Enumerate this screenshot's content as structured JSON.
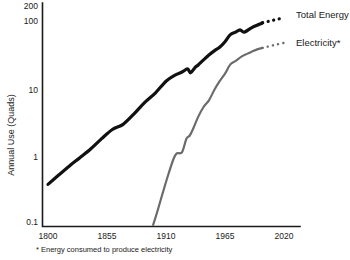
{
  "chart_data": {
    "type": "line",
    "title": "",
    "xlabel": "",
    "ylabel": "Annual Use (Quads)",
    "xlim": [
      1800,
      2020
    ],
    "ylim": [
      0.1,
      200
    ],
    "yscale": "log",
    "grid": false,
    "legend_position": "right-inline",
    "xticks": [
      "1800",
      "1855",
      "1910",
      "1965",
      "2020"
    ],
    "xtick_values": [
      1800,
      1855,
      1910,
      1965,
      2020
    ],
    "yticks": [
      "200",
      "100",
      "10",
      "1",
      "0.1"
    ],
    "ytick_values": [
      200,
      100,
      10,
      1,
      0.1
    ],
    "annotations": [
      "* Energy consumed to produce electricity"
    ],
    "series": [
      {
        "name": "Total Energy",
        "color": "#111111",
        "style": "solid-with-dotted-extension",
        "x": [
          1800,
          1810,
          1820,
          1830,
          1840,
          1850,
          1860,
          1870,
          1880,
          1890,
          1900,
          1910,
          1918,
          1925,
          1930,
          1933,
          1937,
          1940,
          1945,
          1950,
          1955,
          1960,
          1965,
          1970,
          1975,
          1979,
          1983,
          1990,
          1997,
          2000
        ],
        "y": [
          0.4,
          0.55,
          0.75,
          1.0,
          1.35,
          1.9,
          2.6,
          3.1,
          4.4,
          6.5,
          9.0,
          13.5,
          16.5,
          18.5,
          20.5,
          18.0,
          21.5,
          23.5,
          28.0,
          33.0,
          38.0,
          43.0,
          52.0,
          66.0,
          72.0,
          78.0,
          72.0,
          84.0,
          94.0,
          99.0
        ],
        "dotted_x": [
          2000,
          2010,
          2020
        ],
        "dotted_y": [
          99.0,
          108.0,
          118.0
        ]
      },
      {
        "name": "Electricity*",
        "color": "#6b6b6b",
        "style": "solid-with-dotted-extension",
        "x": [
          1898,
          1902,
          1907,
          1912,
          1917,
          1920,
          1925,
          1929,
          1932,
          1935,
          1940,
          1945,
          1950,
          1955,
          1960,
          1965,
          1970,
          1975,
          1980,
          1985,
          1990,
          1995,
          2000
        ],
        "y": [
          0.1,
          0.16,
          0.3,
          0.55,
          0.95,
          1.15,
          1.2,
          1.9,
          2.1,
          2.6,
          4.0,
          5.6,
          7.0,
          10.0,
          13.5,
          17.5,
          24.0,
          27.0,
          31.0,
          34.0,
          37.0,
          40.0,
          42.0
        ],
        "dotted_x": [
          2000,
          2010,
          2020
        ],
        "dotted_y": [
          42.0,
          46.0,
          50.0
        ]
      }
    ]
  },
  "axis": {
    "y_title": "Annual Use (Quads)",
    "y_tick_200": "200",
    "y_tick_100": "100",
    "y_tick_10": "10",
    "y_tick_1": "1",
    "y_tick_0_1": "0.1",
    "x_tick_1800": "1800",
    "x_tick_1855": "1855",
    "x_tick_1910": "1910",
    "x_tick_1965": "1965",
    "x_tick_2020": "2020"
  },
  "labels": {
    "total_energy": "Total Energy",
    "electricity": "Electricity*"
  },
  "footnote": {
    "text": "* Energy consumed to produce electricity"
  },
  "colors": {
    "total_energy": "#111111",
    "electricity": "#6b6b6b",
    "axis": "#1a1a1a",
    "background": "#ffffff"
  }
}
